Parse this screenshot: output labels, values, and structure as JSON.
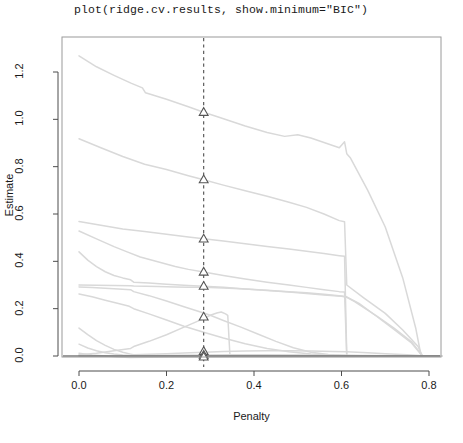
{
  "title": "plot(ridge.cv.results, show.minimum=\"BIC\")",
  "colors": {
    "path_line": "#d9d9d9",
    "axis": "#4d4d4d",
    "frame": "#9a9a9a",
    "marker_stroke": "#555555",
    "marker_fill": "#ffffff",
    "minimum_line": "#4d4d4d",
    "background": "#ffffff",
    "text": "#1a1a1a"
  },
  "chart_data": {
    "type": "line",
    "title": "plot(ridge.cv.results, show.minimum=\"BIC\")",
    "xlabel": "Penalty",
    "ylabel": "Estimate",
    "xlim": [
      -0.038,
      0.829
    ],
    "ylim": [
      -0.035,
      1.32
    ],
    "xticks": [
      0.0,
      0.2,
      0.4,
      0.6,
      0.8
    ],
    "xtick_labels": [
      "0.0",
      "0.2",
      "0.4",
      "0.6",
      "0.8"
    ],
    "yticks": [
      0.0,
      0.2,
      0.4,
      0.6,
      0.8,
      1.0,
      1.2
    ],
    "ytick_labels": [
      "0.0",
      "0.2",
      "0.4",
      "0.6",
      "0.8",
      "1.0",
      "1.2"
    ],
    "grid": false,
    "legend": null,
    "annotations": [
      {
        "name": "bic-minimum-line",
        "type": "vline",
        "x": 0.285,
        "style": "dashed",
        "label": "BIC minimum"
      }
    ],
    "minimum_markers": {
      "symbol": "triangle",
      "x": 0.285,
      "y_values": [
        1.03,
        0.745,
        0.495,
        0.355,
        0.295,
        0.165,
        0.02,
        0.004,
        -0.004
      ]
    },
    "series": [
      {
        "name": "coef-1",
        "points": [
          [
            0.0,
            1.268
          ],
          [
            0.04,
            1.222
          ],
          [
            0.08,
            1.186
          ],
          [
            0.12,
            1.152
          ],
          [
            0.145,
            1.133
          ],
          [
            0.152,
            1.112
          ],
          [
            0.2,
            1.085
          ],
          [
            0.25,
            1.053
          ],
          [
            0.285,
            1.03
          ],
          [
            0.32,
            1.009
          ],
          [
            0.38,
            0.972
          ],
          [
            0.43,
            0.944
          ],
          [
            0.47,
            0.928
          ],
          [
            0.5,
            0.935
          ],
          [
            0.53,
            0.921
          ],
          [
            0.57,
            0.896
          ],
          [
            0.595,
            0.88
          ],
          [
            0.607,
            0.905
          ],
          [
            0.612,
            0.855
          ],
          [
            0.62,
            0.838
          ],
          [
            0.66,
            0.7
          ],
          [
            0.7,
            0.545
          ],
          [
            0.74,
            0.33
          ],
          [
            0.77,
            0.115
          ],
          [
            0.782,
            0.0
          ],
          [
            0.829,
            0.0
          ]
        ]
      },
      {
        "name": "coef-2",
        "points": [
          [
            0.0,
            0.918
          ],
          [
            0.05,
            0.88
          ],
          [
            0.1,
            0.843
          ],
          [
            0.15,
            0.81
          ],
          [
            0.2,
            0.788
          ],
          [
            0.25,
            0.762
          ],
          [
            0.285,
            0.745
          ],
          [
            0.33,
            0.722
          ],
          [
            0.38,
            0.698
          ],
          [
            0.43,
            0.675
          ],
          [
            0.48,
            0.65
          ],
          [
            0.52,
            0.628
          ],
          [
            0.56,
            0.6
          ],
          [
            0.595,
            0.572
          ],
          [
            0.607,
            0.567
          ],
          [
            0.612,
            0.3
          ],
          [
            0.65,
            0.247
          ],
          [
            0.7,
            0.18
          ],
          [
            0.74,
            0.11
          ],
          [
            0.775,
            0.04
          ],
          [
            0.785,
            0.0
          ],
          [
            0.829,
            0.0
          ]
        ]
      },
      {
        "name": "coef-3",
        "points": [
          [
            0.0,
            0.568
          ],
          [
            0.05,
            0.552
          ],
          [
            0.1,
            0.537
          ],
          [
            0.15,
            0.526
          ],
          [
            0.2,
            0.514
          ],
          [
            0.25,
            0.503
          ],
          [
            0.285,
            0.495
          ],
          [
            0.33,
            0.486
          ],
          [
            0.38,
            0.474
          ],
          [
            0.43,
            0.463
          ],
          [
            0.48,
            0.452
          ],
          [
            0.52,
            0.443
          ],
          [
            0.56,
            0.433
          ],
          [
            0.595,
            0.424
          ],
          [
            0.607,
            0.421
          ],
          [
            0.612,
            0.0
          ],
          [
            0.829,
            0.0
          ]
        ]
      },
      {
        "name": "coef-4",
        "points": [
          [
            0.0,
            0.528
          ],
          [
            0.04,
            0.495
          ],
          [
            0.08,
            0.462
          ],
          [
            0.11,
            0.44
          ],
          [
            0.14,
            0.418
          ],
          [
            0.18,
            0.398
          ],
          [
            0.22,
            0.378
          ],
          [
            0.25,
            0.366
          ],
          [
            0.285,
            0.355
          ],
          [
            0.33,
            0.34
          ],
          [
            0.38,
            0.325
          ],
          [
            0.43,
            0.312
          ],
          [
            0.48,
            0.3
          ],
          [
            0.52,
            0.29
          ],
          [
            0.56,
            0.28
          ],
          [
            0.595,
            0.272
          ],
          [
            0.607,
            0.27
          ],
          [
            0.612,
            0.0
          ],
          [
            0.829,
            0.0
          ]
        ]
      },
      {
        "name": "coef-5",
        "points": [
          [
            0.0,
            0.44
          ],
          [
            0.02,
            0.405
          ],
          [
            0.04,
            0.378
          ],
          [
            0.06,
            0.356
          ],
          [
            0.08,
            0.34
          ],
          [
            0.1,
            0.33
          ],
          [
            0.118,
            0.322
          ],
          [
            0.125,
            0.312
          ],
          [
            0.16,
            0.308
          ],
          [
            0.2,
            0.303
          ],
          [
            0.25,
            0.298
          ],
          [
            0.285,
            0.295
          ],
          [
            0.33,
            0.29
          ],
          [
            0.38,
            0.283
          ],
          [
            0.43,
            0.277
          ],
          [
            0.48,
            0.27
          ],
          [
            0.52,
            0.264
          ],
          [
            0.56,
            0.258
          ],
          [
            0.6,
            0.252
          ],
          [
            0.612,
            0.248
          ],
          [
            0.63,
            0.23
          ],
          [
            0.68,
            0.17
          ],
          [
            0.72,
            0.118
          ],
          [
            0.76,
            0.06
          ],
          [
            0.785,
            0.0
          ],
          [
            0.829,
            0.0
          ]
        ]
      },
      {
        "name": "coef-6",
        "points": [
          [
            0.0,
            0.3
          ],
          [
            0.04,
            0.299
          ],
          [
            0.08,
            0.298
          ],
          [
            0.118,
            0.297
          ],
          [
            0.125,
            0.296
          ],
          [
            0.18,
            0.294
          ],
          [
            0.22,
            0.292
          ],
          [
            0.25,
            0.291
          ],
          [
            0.285,
            0.29
          ],
          [
            0.33,
            0.287
          ],
          [
            0.38,
            0.283
          ],
          [
            0.43,
            0.278
          ],
          [
            0.48,
            0.272
          ],
          [
            0.52,
            0.267
          ],
          [
            0.56,
            0.261
          ],
          [
            0.6,
            0.254
          ],
          [
            0.612,
            0.25
          ],
          [
            0.64,
            0.222
          ],
          [
            0.68,
            0.168
          ],
          [
            0.72,
            0.112
          ],
          [
            0.76,
            0.055
          ],
          [
            0.785,
            0.0
          ],
          [
            0.829,
            0.0
          ]
        ]
      },
      {
        "name": "coef-7",
        "points": [
          [
            0.0,
            0.292
          ],
          [
            0.03,
            0.289
          ],
          [
            0.06,
            0.286
          ],
          [
            0.09,
            0.283
          ],
          [
            0.118,
            0.28
          ],
          [
            0.125,
            0.272
          ],
          [
            0.16,
            0.255
          ],
          [
            0.2,
            0.232
          ],
          [
            0.24,
            0.208
          ],
          [
            0.285,
            0.182
          ],
          [
            0.3,
            0.172
          ],
          [
            0.33,
            0.15
          ],
          [
            0.37,
            0.122
          ],
          [
            0.41,
            0.092
          ],
          [
            0.45,
            0.062
          ],
          [
            0.49,
            0.035
          ],
          [
            0.53,
            0.016
          ],
          [
            0.57,
            0.006
          ],
          [
            0.61,
            0.002
          ],
          [
            0.7,
            0.001
          ],
          [
            0.829,
            0.0
          ]
        ]
      },
      {
        "name": "coef-8",
        "points": [
          [
            0.0,
            0.262
          ],
          [
            0.03,
            0.25
          ],
          [
            0.06,
            0.236
          ],
          [
            0.09,
            0.222
          ],
          [
            0.115,
            0.21
          ],
          [
            0.125,
            0.2
          ],
          [
            0.16,
            0.178
          ],
          [
            0.2,
            0.152
          ],
          [
            0.24,
            0.126
          ],
          [
            0.285,
            0.1
          ],
          [
            0.33,
            0.076
          ],
          [
            0.38,
            0.052
          ],
          [
            0.43,
            0.032
          ],
          [
            0.48,
            0.018
          ],
          [
            0.53,
            0.008
          ],
          [
            0.58,
            0.003
          ],
          [
            0.64,
            0.001
          ],
          [
            0.829,
            0.0
          ]
        ]
      },
      {
        "name": "coef-9",
        "points": [
          [
            0.0,
            0.118
          ],
          [
            0.02,
            0.09
          ],
          [
            0.04,
            0.065
          ],
          [
            0.06,
            0.045
          ],
          [
            0.08,
            0.028
          ],
          [
            0.1,
            0.016
          ],
          [
            0.118,
            0.008
          ],
          [
            0.125,
            0.005
          ],
          [
            0.16,
            0.007
          ],
          [
            0.2,
            0.01
          ],
          [
            0.24,
            0.013
          ],
          [
            0.285,
            0.016
          ],
          [
            0.33,
            0.019
          ],
          [
            0.38,
            0.021
          ],
          [
            0.43,
            0.022
          ],
          [
            0.48,
            0.022
          ],
          [
            0.53,
            0.021
          ],
          [
            0.58,
            0.019
          ],
          [
            0.612,
            0.018
          ],
          [
            0.66,
            0.014
          ],
          [
            0.7,
            0.01
          ],
          [
            0.75,
            0.005
          ],
          [
            0.785,
            0.001
          ],
          [
            0.829,
            0.0
          ]
        ]
      },
      {
        "name": "coef-10",
        "points": [
          [
            0.0,
            0.05
          ],
          [
            0.02,
            0.034
          ],
          [
            0.04,
            0.022
          ],
          [
            0.06,
            0.014
          ],
          [
            0.08,
            0.008
          ],
          [
            0.1,
            0.004
          ],
          [
            0.118,
            0.002
          ],
          [
            0.16,
            0.002
          ],
          [
            0.22,
            0.003
          ],
          [
            0.285,
            0.004
          ],
          [
            0.35,
            0.005
          ],
          [
            0.42,
            0.005
          ],
          [
            0.5,
            0.004
          ],
          [
            0.57,
            0.003
          ],
          [
            0.612,
            0.002
          ],
          [
            0.7,
            0.001
          ],
          [
            0.829,
            0.0
          ]
        ]
      },
      {
        "name": "coef-11",
        "points": [
          [
            0.0,
            0.012
          ],
          [
            0.03,
            0.004
          ],
          [
            0.06,
            0.0
          ],
          [
            0.09,
            -0.004
          ],
          [
            0.118,
            -0.006
          ],
          [
            0.16,
            -0.005
          ],
          [
            0.22,
            -0.004
          ],
          [
            0.285,
            -0.004
          ],
          [
            0.36,
            -0.003
          ],
          [
            0.45,
            -0.003
          ],
          [
            0.55,
            -0.002
          ],
          [
            0.612,
            -0.002
          ],
          [
            0.7,
            -0.001
          ],
          [
            0.829,
            0.0
          ]
        ]
      },
      {
        "name": "coef-12-rising",
        "points": [
          [
            0.0,
            0.005
          ],
          [
            0.04,
            0.012
          ],
          [
            0.08,
            0.022
          ],
          [
            0.118,
            0.032
          ],
          [
            0.125,
            0.04
          ],
          [
            0.16,
            0.062
          ],
          [
            0.2,
            0.09
          ],
          [
            0.24,
            0.122
          ],
          [
            0.285,
            0.158
          ],
          [
            0.3,
            0.172
          ],
          [
            0.315,
            0.182
          ],
          [
            0.325,
            0.186
          ],
          [
            0.335,
            0.178
          ],
          [
            0.34,
            0.172
          ],
          [
            0.345,
            0.002
          ],
          [
            0.4,
            0.002
          ],
          [
            0.5,
            0.002
          ],
          [
            0.612,
            0.002
          ],
          [
            0.829,
            0.0
          ]
        ]
      },
      {
        "name": "coef-13-zero",
        "points": [
          [
            0.0,
            0.0
          ],
          [
            0.2,
            0.0
          ],
          [
            0.4,
            0.0
          ],
          [
            0.6,
            0.0
          ],
          [
            0.829,
            0.0
          ]
        ]
      }
    ]
  }
}
